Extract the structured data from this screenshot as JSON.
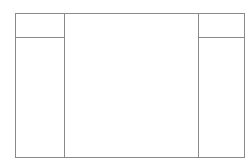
{
  "diagram": {
    "type": "three-column-layout-wireframe",
    "line_color": "#8a8a8a",
    "background_color": "#ffffff",
    "left_column": {
      "header_label": "",
      "body_label": ""
    },
    "center_panel": {
      "label": ""
    },
    "right_column": {
      "header_label": "",
      "body_label": ""
    }
  }
}
